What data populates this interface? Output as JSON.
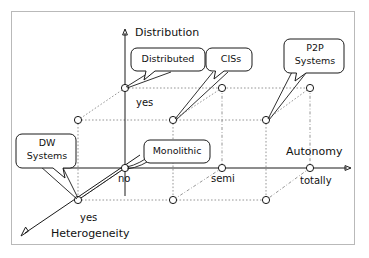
{
  "diagram": {
    "axes": {
      "vertical": {
        "name": "Distribution",
        "ticks": [
          "no",
          "yes"
        ]
      },
      "horizontal": {
        "name": "Autonomy",
        "ticks": [
          "no",
          "semi",
          "totally"
        ]
      },
      "depth": {
        "name": "Heterogeneity",
        "ticks": [
          "no",
          "yes"
        ]
      }
    },
    "tick_labels": {
      "dist_yes": "yes",
      "auto_no": "no",
      "auto_semi": "semi",
      "auto_totally": "totally",
      "het_yes": "yes"
    },
    "axis_labels": {
      "distribution": "Distribution",
      "autonomy": "Autonomy",
      "heterogeneity": "Heterogeneity"
    },
    "callouts": [
      {
        "id": "distributed",
        "lines": [
          "Distributed"
        ],
        "target": "front-top-left"
      },
      {
        "id": "ciss",
        "lines": [
          "CISs"
        ],
        "target": "mid-back-mid"
      },
      {
        "id": "p2p",
        "lines": [
          "P2P",
          "Systems"
        ],
        "target": "right-back-mid"
      },
      {
        "id": "dw",
        "lines": [
          "DW",
          "Systems"
        ],
        "target": "origin-depth"
      },
      {
        "id": "monolithic",
        "lines": [
          "Monolithic"
        ],
        "target": "front-origin"
      }
    ],
    "nodes": [
      {
        "id": "front-top-left",
        "x": 125,
        "y": 88
      },
      {
        "id": "front-top-mid",
        "x": 222,
        "y": 88
      },
      {
        "id": "front-top-right",
        "x": 310,
        "y": 88
      },
      {
        "id": "back-top-left",
        "x": 78,
        "y": 120
      },
      {
        "id": "mid-back-mid",
        "x": 173,
        "y": 120
      },
      {
        "id": "right-back-mid",
        "x": 266,
        "y": 120
      },
      {
        "id": "front-origin",
        "x": 125,
        "y": 168
      },
      {
        "id": "front-axis-semi",
        "x": 222,
        "y": 168
      },
      {
        "id": "front-axis-tot",
        "x": 310,
        "y": 168
      },
      {
        "id": "origin-depth",
        "x": 78,
        "y": 200
      },
      {
        "id": "low-back-mid",
        "x": 173,
        "y": 200
      },
      {
        "id": "low-back-right",
        "x": 266,
        "y": 200
      }
    ],
    "colors": {
      "ink": "#1a1a1a",
      "grid": "#8a8a8a",
      "frame": "#b9b9b9",
      "paper": "#ffffff"
    }
  }
}
